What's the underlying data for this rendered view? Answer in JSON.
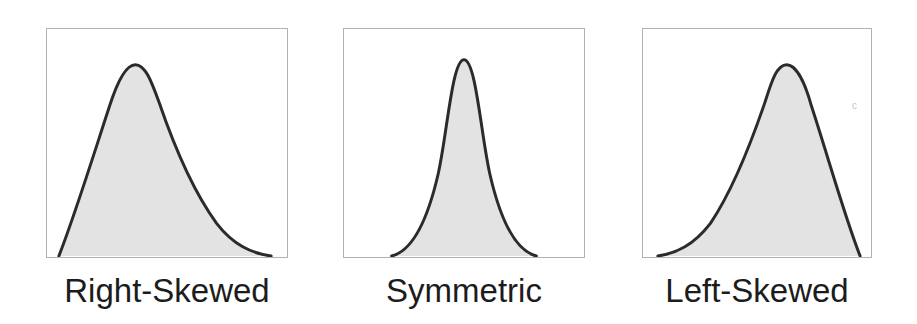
{
  "figure": {
    "background": "#ffffff"
  },
  "colors": {
    "curve_stroke": "#2b2b2b",
    "curve_fill": "#e3e3e3",
    "panel_border": "#b2b2b2",
    "label_text": "#1c1c1c"
  },
  "panels": [
    {
      "id": "right-skewed",
      "label": "Right-Skewed",
      "skew": "right",
      "tail_direction": "right",
      "peak_position_fraction": 0.37,
      "path": "M 12 229 C 28 188, 46 130, 63 78 C 70 56, 79 36, 89 36 C 99 36, 105 52, 113 74 C 126 112, 146 162, 171 196 C 188 218, 206 226, 226 229"
    },
    {
      "id": "symmetric",
      "label": "Symmetric",
      "skew": "none",
      "tail_direction": "both",
      "peak_position_fraction": 0.5,
      "path": "M 48 229 C 68 224, 84 194, 95 146 C 104 106, 109 31, 121 31 C 133 31, 138 106, 147 146 C 158 194, 174 224, 194 229"
    },
    {
      "id": "left-skewed",
      "label": "Left-Skewed",
      "skew": "left",
      "tail_direction": "left",
      "peak_position_fraction": 0.63,
      "path": "M 15 229 C 34 226, 51 218, 68 196 C 91 162, 110 112, 123 74 C 130 52, 135 36, 145 36 C 155 36, 164 56, 170 78 C 187 130, 203 188, 219 229"
    }
  ],
  "artifact": {
    "glyph": "c"
  }
}
